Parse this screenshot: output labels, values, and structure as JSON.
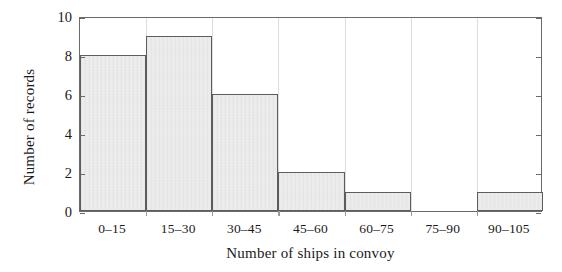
{
  "chart_data": {
    "type": "bar",
    "title": "",
    "subtitle": "",
    "xlabel": "Number of ships in convoy",
    "ylabel": "Number of records",
    "categories": [
      "0–15",
      "15–30",
      "30–45",
      "45–60",
      "60–75",
      "75–90",
      "90–105"
    ],
    "values": [
      8,
      9,
      6,
      2,
      1,
      0,
      1
    ],
    "ylim": [
      0,
      10
    ],
    "yticks": [
      0,
      2,
      4,
      6,
      8,
      10
    ],
    "ytick_labels": [
      "0",
      "2",
      "4",
      "6",
      "8",
      "10"
    ],
    "grid": "vertical-only",
    "legend": "none",
    "bar_fill_color": "#e2e2e2",
    "bar_edge_color": "#5d5d5d",
    "axis_color": "#6a6a6a",
    "grid_color": "#dddddd",
    "background_color": "#ffffff",
    "text_color": "#1a1a1a"
  }
}
